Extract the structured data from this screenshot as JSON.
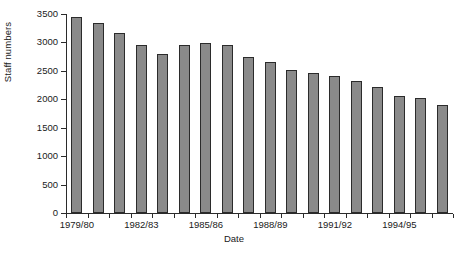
{
  "chart_data": {
    "type": "bar",
    "title": "",
    "xlabel": "Date",
    "ylabel": "Staff numbers",
    "ylim": [
      0,
      3500
    ],
    "yticks": [
      0,
      500,
      1000,
      1500,
      2000,
      2500,
      3000,
      3500
    ],
    "ytick_labels": [
      "0",
      "500",
      "1000",
      "1500",
      "2000",
      "2500",
      "3000",
      "3500"
    ],
    "grid": false,
    "legend": "none",
    "categories": [
      "1979/80",
      "1980/81",
      "1981/82",
      "1982/83",
      "1983/84",
      "1984/85",
      "1985/86",
      "1986/87",
      "1987/88",
      "1988/89",
      "1989/90",
      "1990/91",
      "1991/92",
      "1992/93",
      "1993/94",
      "1994/95",
      "1995/96",
      "1996/97"
    ],
    "values": [
      3450,
      3350,
      3160,
      2960,
      2800,
      2950,
      2990,
      2950,
      2740,
      2650,
      2510,
      2470,
      2410,
      2320,
      2210,
      2060,
      2030,
      1900
    ],
    "xtick_labels": [
      "1979/80",
      "1982/83",
      "1985/86",
      "1988/89",
      "1991/92",
      "1994/95"
    ],
    "xtick_indices": [
      0,
      3,
      6,
      9,
      12,
      15
    ],
    "bar_color": "#8a8a8a",
    "bar_edge_color": "#2b2b2b",
    "axis_color": "#2b2b2b"
  }
}
